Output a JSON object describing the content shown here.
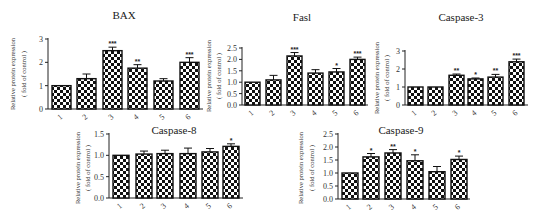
{
  "figure": {
    "x_categories": [
      "1",
      "2",
      "3",
      "4",
      "5",
      "6"
    ],
    "ylabel_line1": "Relative protein expression",
    "ylabel_line2": "( fold of control )",
    "bar_fill": "checkerboard",
    "bar_colors": {
      "dark": "#111111",
      "light": "#ffffff"
    }
  },
  "chart_data": [
    {
      "type": "bar",
      "title": "BAX",
      "xlabel": "",
      "ylabel": "Relative protein expression ( fold of control )",
      "categories": [
        "1",
        "2",
        "3",
        "4",
        "5",
        "6"
      ],
      "values": [
        1.0,
        1.3,
        2.5,
        1.75,
        1.2,
        2.0
      ],
      "error_upper": [
        1.0,
        1.5,
        2.65,
        1.9,
        1.3,
        2.2
      ],
      "significance": [
        "",
        "",
        "***",
        "**",
        "",
        "***"
      ],
      "ylim": [
        0,
        3
      ],
      "yticks": [
        "0",
        "1",
        "2",
        "3"
      ],
      "grid": false,
      "legend": null
    },
    {
      "type": "bar",
      "title": "Fasl",
      "xlabel": "",
      "ylabel": "Relative protein expression ( fold of control )",
      "categories": [
        "1",
        "2",
        "3",
        "4",
        "5",
        "6"
      ],
      "values": [
        1.0,
        1.1,
        2.15,
        1.4,
        1.45,
        2.0
      ],
      "error_upper": [
        1.0,
        1.3,
        2.3,
        1.55,
        1.6,
        2.1
      ],
      "significance": [
        "",
        "",
        "***",
        "",
        "*",
        "***"
      ],
      "ylim": [
        0,
        2.5
      ],
      "yticks": [
        "0.0",
        "0.5",
        "1.0",
        "1.5",
        "2.0",
        "2.5"
      ],
      "grid": false,
      "legend": null
    },
    {
      "type": "bar",
      "title": "Caspase-3",
      "xlabel": "",
      "ylabel": "Relative protein expression ( fold of control )",
      "categories": [
        "1",
        "2",
        "3",
        "4",
        "5",
        "6"
      ],
      "values": [
        1.0,
        1.0,
        1.65,
        1.45,
        1.55,
        2.4
      ],
      "error_upper": [
        1.0,
        1.0,
        1.72,
        1.5,
        1.7,
        2.55
      ],
      "significance": [
        "",
        "",
        "**",
        "*",
        "**",
        "***"
      ],
      "ylim": [
        0,
        3
      ],
      "yticks": [
        "0",
        "1",
        "2",
        "3"
      ],
      "grid": false,
      "legend": null
    },
    {
      "type": "bar",
      "title": "Caspase-8",
      "xlabel": "",
      "ylabel": "Relative protein expression ( fold of control )",
      "categories": [
        "1",
        "2",
        "3",
        "4",
        "5",
        "6"
      ],
      "values": [
        1.0,
        1.03,
        1.04,
        1.04,
        1.08,
        1.21
      ],
      "error_upper": [
        1.0,
        1.1,
        1.12,
        1.17,
        1.16,
        1.27
      ],
      "significance": [
        "",
        "",
        "",
        "",
        "",
        "*"
      ],
      "ylim": [
        0,
        1.5
      ],
      "yticks": [
        "0.0",
        "0.5",
        "1.0",
        "1.5"
      ],
      "grid": false,
      "legend": null
    },
    {
      "type": "bar",
      "title": "Caspase-9",
      "xlabel": "",
      "ylabel": "Relative protein expression ( fold of control )",
      "categories": [
        "1",
        "2",
        "3",
        "4",
        "5",
        "6"
      ],
      "values": [
        1.0,
        1.62,
        1.77,
        1.47,
        1.05,
        1.52
      ],
      "error_upper": [
        1.0,
        1.75,
        1.9,
        1.7,
        1.25,
        1.65
      ],
      "significance": [
        "",
        "*",
        "**",
        "*",
        "",
        "*"
      ],
      "ylim": [
        0,
        2.5
      ],
      "yticks": [
        "0.0",
        "0.5",
        "1.0",
        "1.5",
        "2.0",
        "2.5"
      ],
      "grid": false,
      "legend": null
    }
  ]
}
